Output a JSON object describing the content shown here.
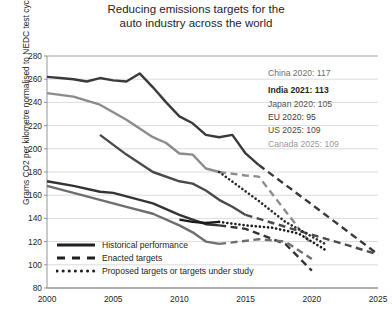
{
  "chart_data": {
    "type": "line",
    "title": "Reducing emissions targets for the auto industry across the world",
    "title_line1": "Reducing emissions targets for the",
    "title_line2": "auto industry across the world",
    "xlabel": "",
    "ylabel": "Grams CO2 per kilometre normalised to NEDC test cycle",
    "xlim": [
      2000,
      2025
    ],
    "ylim": [
      80,
      280
    ],
    "xticks": [
      "2000",
      "2005",
      "2010",
      "2015",
      "2020",
      "2025"
    ],
    "xtick_values": [
      2000,
      2005,
      2010,
      2015,
      2020,
      2025
    ],
    "yticks": [
      "80",
      "100",
      "120",
      "140",
      "160",
      "180",
      "200",
      "220",
      "240",
      "260",
      "280"
    ],
    "ytick_values": [
      80,
      100,
      120,
      140,
      160,
      180,
      200,
      220,
      240,
      260,
      280
    ],
    "grid": "horizontal",
    "legend_position": "bottom-left",
    "legend": [
      {
        "key": "historical",
        "label": "Historical performance",
        "style": "solid"
      },
      {
        "key": "enacted",
        "label": "Enacted targets",
        "style": "dashed"
      },
      {
        "key": "proposed",
        "label": "Proposed targets or targets under study",
        "style": "dotted"
      }
    ],
    "annotations": [
      {
        "name": "china",
        "text": "China 2020: 117",
        "color": "#6e6e6e",
        "weight": "normal"
      },
      {
        "name": "india",
        "text": "India 2021: 113",
        "color": "#231f20",
        "weight": "bold"
      },
      {
        "name": "japan",
        "text": "Japan 2020: 105",
        "color": "#555555",
        "weight": "normal"
      },
      {
        "name": "eu",
        "text": "EU 2020: 95",
        "color": "#3a3a3a",
        "weight": "normal"
      },
      {
        "name": "us",
        "text": "US 2025: 109",
        "color": "#4a4a4a",
        "weight": "normal"
      },
      {
        "name": "canada",
        "text": "Canada 2025: 109",
        "color": "#9a9a9a",
        "weight": "normal"
      }
    ],
    "series": [
      {
        "name": "Canada",
        "color": "#3a3a3a",
        "historical": [
          [
            2000,
            262
          ],
          [
            2001,
            261
          ],
          [
            2002,
            260
          ],
          [
            2003,
            258
          ],
          [
            2004,
            261
          ],
          [
            2005,
            259
          ],
          [
            2006,
            258
          ],
          [
            2007,
            265
          ],
          [
            2008,
            253
          ],
          [
            2009,
            240
          ],
          [
            2010,
            228
          ],
          [
            2011,
            222
          ],
          [
            2012,
            212
          ],
          [
            2013,
            210
          ],
          [
            2014,
            212
          ],
          [
            2015,
            196
          ],
          [
            2016,
            186
          ]
        ],
        "enacted": [
          [
            2016,
            186
          ],
          [
            2020,
            152
          ],
          [
            2025,
            109
          ]
        ],
        "proposed": []
      },
      {
        "name": "China",
        "color": "#8c8c8c",
        "historical": [
          [
            2000,
            248
          ],
          [
            2002,
            245
          ],
          [
            2004,
            238
          ],
          [
            2006,
            225
          ],
          [
            2008,
            210
          ],
          [
            2009,
            205
          ],
          [
            2010,
            196
          ],
          [
            2011,
            195
          ],
          [
            2012,
            183
          ],
          [
            2013,
            180
          ]
        ],
        "enacted": [
          [
            2013,
            180
          ],
          [
            2015,
            177
          ],
          [
            2016,
            176
          ],
          [
            2020,
            117
          ]
        ],
        "proposed": []
      },
      {
        "name": "US",
        "color": "#4a4a4a",
        "historical": [
          [
            2004,
            212
          ],
          [
            2006,
            195
          ],
          [
            2008,
            180
          ],
          [
            2010,
            172
          ],
          [
            2011,
            170
          ],
          [
            2012,
            164
          ],
          [
            2013,
            156
          ],
          [
            2014,
            150
          ],
          [
            2015,
            143
          ]
        ],
        "enacted": [
          [
            2015,
            143
          ],
          [
            2020,
            126
          ],
          [
            2025,
            109
          ]
        ],
        "proposed": []
      },
      {
        "name": "EU",
        "color": "#333333",
        "historical": [
          [
            2000,
            172
          ],
          [
            2002,
            168
          ],
          [
            2004,
            163
          ],
          [
            2005,
            162
          ],
          [
            2006,
            159
          ],
          [
            2008,
            153
          ],
          [
            2010,
            143
          ],
          [
            2011,
            139
          ],
          [
            2012,
            135
          ],
          [
            2013,
            134
          ]
        ],
        "enacted": [
          [
            2013,
            134
          ],
          [
            2015,
            131
          ],
          [
            2018,
            118
          ],
          [
            2020,
            95
          ]
        ],
        "proposed": []
      },
      {
        "name": "Japan",
        "color": "#6e6e6e",
        "historical": [
          [
            2000,
            168
          ],
          [
            2002,
            162
          ],
          [
            2004,
            156
          ],
          [
            2006,
            150
          ],
          [
            2008,
            144
          ],
          [
            2010,
            134
          ],
          [
            2011,
            128
          ],
          [
            2012,
            120
          ],
          [
            2013,
            118
          ]
        ],
        "enacted": [
          [
            2013,
            118
          ],
          [
            2016,
            122
          ],
          [
            2018,
            120
          ],
          [
            2020,
            105
          ]
        ],
        "proposed": []
      },
      {
        "name": "India",
        "color": "#1a1a1a",
        "historical": [
          [
            2010,
            139
          ],
          [
            2011,
            137
          ],
          [
            2012,
            136
          ],
          [
            2013,
            137
          ]
        ],
        "enacted": [],
        "proposed": [
          [
            2013,
            137
          ],
          [
            2015,
            134
          ],
          [
            2017,
            132
          ],
          [
            2019,
            127
          ],
          [
            2021,
            113
          ]
        ]
      },
      {
        "name": "Mexico",
        "color": "#2b2b2b",
        "historical": [],
        "enacted": [],
        "proposed": [
          [
            2013,
            180
          ],
          [
            2016,
            155
          ],
          [
            2018,
            137
          ],
          [
            2021,
            118
          ]
        ]
      }
    ]
  }
}
